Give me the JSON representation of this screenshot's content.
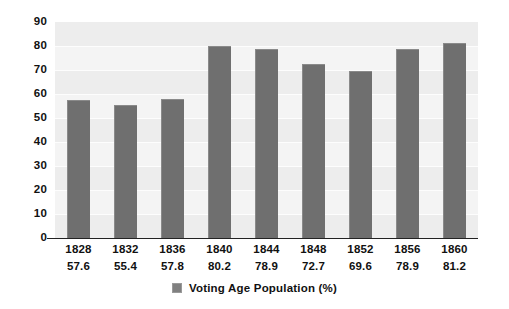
{
  "chart_data": {
    "type": "bar",
    "title": "",
    "xlabel": "",
    "ylabel": "",
    "ylim": [
      0,
      90
    ],
    "y_ticks": [
      90,
      80,
      70,
      60,
      50,
      40,
      30,
      20,
      10,
      0
    ],
    "grid": true,
    "legend_position": "bottom",
    "bar_color": "#6f6f6f",
    "plot_background": "#f4f4f4",
    "categories": [
      "1828",
      "1832",
      "1836",
      "1840",
      "1844",
      "1848",
      "1852",
      "1856",
      "1860"
    ],
    "values": [
      57.6,
      55.4,
      57.8,
      80.2,
      78.9,
      72.7,
      69.6,
      78.9,
      81.2
    ],
    "value_labels": [
      "57.6",
      "55.4",
      "57.8",
      "80.2",
      "78.9",
      "72.7",
      "69.6",
      "78.9",
      "81.2"
    ],
    "series": [
      {
        "name": "Voting Age Population (%)",
        "values": [
          57.6,
          55.4,
          57.8,
          80.2,
          78.9,
          72.7,
          69.6,
          78.9,
          81.2
        ]
      }
    ],
    "legend": [
      {
        "label": "Voting Age Population (%)",
        "color": "#808080"
      }
    ]
  }
}
